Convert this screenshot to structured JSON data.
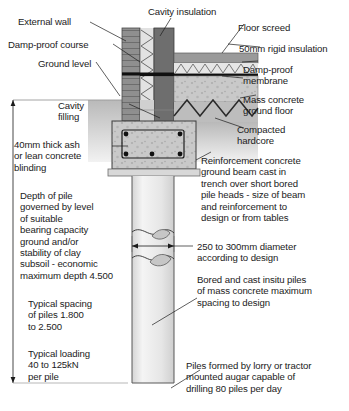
{
  "figure": {
    "caption": ""
  },
  "colors": {
    "ink": "#1b1b1b",
    "brick_dark": "#808080",
    "brick_light": "#a8a8a8",
    "cavity_fill": "#d8d8d8",
    "inner_leaf": "#6e6e6e",
    "screed": "#9a9a9a",
    "insulation": "#dcdcdc",
    "hardcore": "#d2d2d2",
    "mass_concrete": "#c2c2c2",
    "soil": "#c0c0c0",
    "beam": "#bdbdbd",
    "pile": "#ededed",
    "dpc": "#111111",
    "blinding": "#cfcfcf"
  },
  "labels": {
    "external_wall": "External wall",
    "cavity_insulation": "Cavity insulation",
    "floor_screed": "Floor screed",
    "damp_proof_course": "Damp-proof course",
    "rigid_insulation": "50mm rigid insulation",
    "ground_level": "Ground level",
    "damp_proof_membrane": "Damp-proof\nmembrane",
    "mass_concrete_ground_floor": "Mass concrete\nground floor",
    "cavity_filling": "Cavity\nfilling",
    "compacted_hardcore": "Compacted\nhardcore",
    "blinding": "40mm thick ash\nor lean concrete\nblinding",
    "ground_beam": "Reinforcement concrete\nground beam cast in\ntrench over short bored\npile heads - size of beam\nand reinforcement to\ndesign or from tables",
    "depth_of_pile": "Depth of pile\ngoverned by level\nof suitable\nbearing capacity\nground and/or\nstability of clay\nsubsoil - economic\nmaximum depth 4.500",
    "pile_diameter": "250 to 300mm diameter\naccording to design",
    "bored_piles": "Bored and cast insitu piles\nof mass concrete maximum\nspacing to design",
    "typical_spacing": "Typical spacing\nof piles 1.800\nto 2.500",
    "typical_loading": "Typical loading\n40 to 125kN\nper pile",
    "piles_formed": "Piles formed by lorry or tractor\nmounted augar capable of\ndrilling 80 piles per day"
  },
  "dimensions": {
    "pile_diameter_value": "250 to 300mm",
    "max_depth_value": "4.500",
    "spacing_min": "1.800",
    "spacing_max": "2.500",
    "loading_min": "40",
    "loading_max": "125kN",
    "piles_per_day": "80",
    "blinding_thickness": "40mm",
    "rigid_insulation_thickness": "50mm"
  }
}
